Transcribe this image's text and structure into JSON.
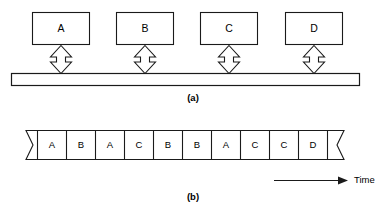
{
  "figure": {
    "panel_a": {
      "caption": "(a)",
      "nodes": [
        {
          "label": "A"
        },
        {
          "label": "B"
        },
        {
          "label": "C"
        },
        {
          "label": "D"
        }
      ],
      "connector_icon": "double-headed-vertical-arrow",
      "bus_name": "shared-bus"
    },
    "panel_b": {
      "caption": "(b)",
      "axis_label": "Time",
      "axis_arrow_icon": "right-arrow-icon",
      "left_break_icon": "broken-edge-icon",
      "right_break_icon": "broken-edge-icon",
      "slots": [
        {
          "label": "A"
        },
        {
          "label": "B"
        },
        {
          "label": "A"
        },
        {
          "label": "C"
        },
        {
          "label": "B"
        },
        {
          "label": "B"
        },
        {
          "label": "A"
        },
        {
          "label": "C"
        },
        {
          "label": "C"
        },
        {
          "label": "D"
        }
      ]
    }
  },
  "colors": {
    "stroke": "#1a1a1a",
    "fill": "#ffffff",
    "text": "#000000"
  }
}
